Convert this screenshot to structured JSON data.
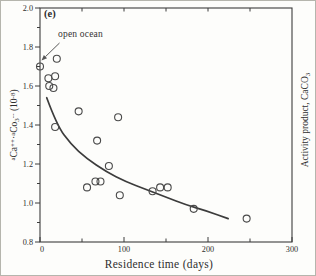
{
  "chart_data": {
    "type": "scatter",
    "panel_label": "(e)",
    "xlabel": "Residence time (days)",
    "ylabel": "aCa++ . aCO3-- (10-8)",
    "ylabel_parts": [
      {
        "t": "a",
        "sup": true
      },
      {
        "t": "Ca"
      },
      {
        "t": "++",
        "sup": true
      },
      {
        "t": "·"
      },
      {
        "t": "a",
        "sup": true
      },
      {
        "t": "Co"
      },
      {
        "t": "3",
        "sub": true
      },
      {
        "t": "--",
        "sup": true
      },
      {
        "t": " (10"
      },
      {
        "t": "-8",
        "sup": true
      },
      {
        "t": ")"
      }
    ],
    "ylabel_right": "Activity product, CaCO3",
    "ylabel_right_parts": [
      {
        "t": "Activity product, CaCO"
      },
      {
        "t": "3",
        "sub": true
      }
    ],
    "annotation": {
      "text": "open ocean",
      "points_to_x": 0,
      "points_to_y": 1.7
    },
    "xlim": [
      0,
      300
    ],
    "ylim": [
      0.8,
      2.0
    ],
    "grid": false,
    "legend": null,
    "x_major_ticks": [
      {
        "v": 0,
        "label": "0"
      },
      {
        "v": 100,
        "label": "100"
      },
      {
        "v": 200,
        "label": "200"
      },
      {
        "v": 300,
        "label": "300"
      }
    ],
    "x_minor_ticks": [
      50,
      150,
      250
    ],
    "x_top_ticks": [
      50,
      100,
      150,
      200,
      250
    ],
    "y_major_ticks": [
      {
        "v": 2.0,
        "label": "2.0"
      },
      {
        "v": 1.8,
        "label": "1.8"
      },
      {
        "v": 1.6,
        "label": "1.6"
      },
      {
        "v": 1.4,
        "label": "1.4"
      },
      {
        "v": 1.2,
        "label": "1.2"
      },
      {
        "v": 1.0,
        "label": "1.0"
      },
      {
        "v": 0.8,
        "label": "0.8"
      }
    ],
    "y_minor_ticks": [
      1.9,
      1.7,
      1.5,
      1.3,
      1.1,
      0.9
    ],
    "points": [
      [
        0,
        1.7
      ],
      [
        20,
        1.74
      ],
      [
        10,
        1.64
      ],
      [
        18,
        1.65
      ],
      [
        11,
        1.6
      ],
      [
        16,
        1.59
      ],
      [
        18,
        1.39
      ],
      [
        46,
        1.47
      ],
      [
        68,
        1.32
      ],
      [
        93,
        1.44
      ],
      [
        56,
        1.08
      ],
      [
        66,
        1.11
      ],
      [
        72,
        1.11
      ],
      [
        82,
        1.19
      ],
      [
        95,
        1.04
      ],
      [
        134,
        1.06
      ],
      [
        143,
        1.08
      ],
      [
        152,
        1.08
      ],
      [
        183,
        0.97
      ],
      [
        246,
        0.92
      ]
    ],
    "curve": [
      [
        8,
        1.54
      ],
      [
        20,
        1.4
      ],
      [
        37,
        1.3
      ],
      [
        55,
        1.23
      ],
      [
        79,
        1.16
      ],
      [
        102,
        1.11
      ],
      [
        126,
        1.07
      ],
      [
        150,
        1.03
      ],
      [
        174,
        0.99
      ],
      [
        198,
        0.96
      ],
      [
        224,
        0.92
      ]
    ],
    "colors": {
      "ink": "#3c3c3c",
      "text": "#2e2e2e",
      "background": "#fdfdfb"
    }
  }
}
